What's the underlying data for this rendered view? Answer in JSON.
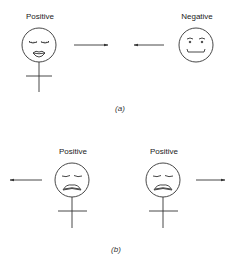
{
  "panel_a": {
    "caption": "(a)",
    "left_figure": {
      "label": "Positive",
      "expression": "content-closed-eyes-lipped-smile",
      "symbol": "female"
    },
    "right_figure": {
      "label": "Negative",
      "expression": "smirk",
      "symbol": "none"
    },
    "arrows": [
      {
        "direction": "right",
        "meaning": "attraction"
      },
      {
        "direction": "left",
        "meaning": "attraction"
      }
    ]
  },
  "panel_b": {
    "caption": "(b)",
    "left_figure": {
      "label": "Positive",
      "expression": "sad-closed-eyes",
      "symbol": "female"
    },
    "right_figure": {
      "label": "Positive",
      "expression": "sad-closed-eyes",
      "symbol": "female"
    },
    "arrows": [
      {
        "direction": "left",
        "meaning": "repulsion"
      },
      {
        "direction": "right",
        "meaning": "repulsion"
      }
    ]
  },
  "colors": {
    "stroke": "#333333",
    "background": "#ffffff"
  }
}
